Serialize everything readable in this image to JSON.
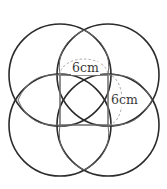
{
  "figure": {
    "labels": {
      "top_side": "6cm",
      "right_side": "6cm"
    },
    "square": {
      "side_cm": 6
    },
    "colors": {
      "outer_circles": "#2b2b2b",
      "inner_lines": "#6a6a6a",
      "dashed_arcs": "#a0a0a0",
      "background": "#ffffff"
    }
  }
}
